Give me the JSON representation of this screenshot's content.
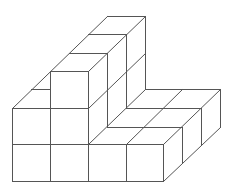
{
  "figure": {
    "stroke_color": "#555555",
    "stroke_width": 1,
    "background": "#ffffff",
    "width": 231,
    "height": 189,
    "groups": [
      {
        "name": "front-face",
        "lines": [
          [
            12,
            181,
            163,
            181
          ],
          [
            12,
            144,
            163,
            144
          ],
          [
            12,
            108,
            88,
            108
          ],
          [
            50,
            71,
            88,
            71
          ],
          [
            12,
            108,
            12,
            181
          ],
          [
            50,
            71,
            50,
            181
          ],
          [
            88,
            71,
            88,
            181
          ],
          [
            126,
            144,
            126,
            181
          ],
          [
            163,
            144,
            163,
            181
          ]
        ]
      },
      {
        "name": "ridge-top",
        "lines": [
          [
            69,
            53,
            107,
            53
          ],
          [
            88,
            34,
            126,
            34
          ],
          [
            107,
            16,
            145,
            16
          ],
          [
            12,
            108,
            107,
            16
          ],
          [
            31,
            89,
            50,
            89
          ],
          [
            88,
            71,
            145,
            16
          ]
        ]
      },
      {
        "name": "ridge-right-face",
        "lines": [
          [
            88,
            108,
            145,
            53
          ],
          [
            88,
            144,
            145,
            89
          ],
          [
            107,
            53,
            107,
            127
          ],
          [
            126,
            34,
            126,
            108
          ],
          [
            145,
            16,
            145,
            89
          ]
        ]
      },
      {
        "name": "platform",
        "lines": [
          [
            107,
            127,
            182,
            127
          ],
          [
            126,
            108,
            201,
            108
          ],
          [
            145,
            89,
            220,
            89
          ],
          [
            126,
            144,
            182,
            89
          ],
          [
            163,
            144,
            220,
            89
          ],
          [
            182,
            127,
            182,
            163
          ],
          [
            201,
            108,
            201,
            145
          ],
          [
            220,
            89,
            220,
            127
          ],
          [
            163,
            181,
            220,
            127
          ]
        ]
      }
    ]
  }
}
